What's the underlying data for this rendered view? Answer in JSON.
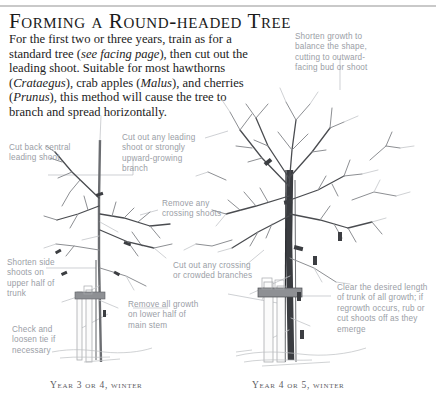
{
  "page": {
    "title": "Forming a Round-headed Tree",
    "body": [
      {
        "text": "For the first two or three years, train as for "
      },
      {
        "text": "a standard tree (",
        "type": "plain"
      },
      {
        "text": "see facing page",
        "type": "italic"
      },
      {
        "text": "), then cut ",
        "type": "plain"
      },
      {
        "text": "out the leading shoot. Suitable for most ",
        "type": "plain"
      },
      {
        "text": "hawthorns (",
        "type": "plain"
      },
      {
        "text": "Crataegus",
        "type": "italic"
      },
      {
        "text": "), crab apples (",
        "type": "plain"
      },
      {
        "text": "Malus",
        "type": "italic"
      },
      {
        "text": "), ",
        "type": "plain"
      },
      {
        "text": "and cherries (",
        "type": "plain"
      },
      {
        "text": "Prunus",
        "type": "italic"
      },
      {
        "text": "), this method will cause ",
        "type": "plain"
      },
      {
        "text": "the tree to branch and spread horizontally.",
        "type": "plain"
      }
    ],
    "body_plain": "For the first two or three years, train as for a standard tree (see facing page), then cut out the leading shoot. Suitable for most hawthorns (Crataegus), crab apples (Malus), and cherries (Prunus), this method will cause the tree to branch and spread horizontally."
  },
  "labels": {
    "shorten_growth": "Shorten growth to balance the shape, cutting to outward-facing bud or shoot",
    "cut_back_central": "Cut back central leading shoot",
    "cut_out_leading": "Cut out any leading shoot or strongly upward-growing branch",
    "remove_crossing": "Remove any crossing shoots",
    "shorten_side": "Shorten side shoots on upper half of trunk",
    "cut_out_crowded": "Cut out any crossing or crowded branches",
    "check_tie": "Check and loosen tie if necessary",
    "remove_growth": "Remove all growth on lower half of main stem",
    "clear_trunk": "Clear the desired length of trunk of all growth; if regrowth occurs, rub or cut shoots off as they emerge"
  },
  "captions": {
    "left": "Year 3 or 4, winter",
    "right": "Year 4 or 5, winter"
  },
  "colors": {
    "rule": "#c9c9c9",
    "title": "#1a1a1a",
    "body": "#232323",
    "label": "#9a9ea6",
    "caption": "#5d5d63",
    "leader": "#b9bcc2",
    "branch_light": "#8d8f93",
    "branch_dark": "#4a4c50",
    "trunk_dark": "#3a3c40",
    "cutmark": "#3c3e42",
    "background": "#ffffff"
  }
}
